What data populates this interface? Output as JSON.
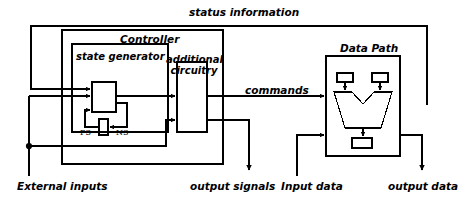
{
  "diagram": {
    "title_visible": false,
    "type": "block-diagram",
    "colors": {
      "line": "#000000",
      "background": "#ffffff",
      "text": "#000000"
    },
    "labels": {
      "status_information": "status information",
      "controller": "Controller",
      "state_generator": "state generator",
      "additional_circuitry_line1": "additional",
      "additional_circuitry_line2": "circuitry",
      "commands": "commands",
      "data_path": "Data Path",
      "ps": "PS",
      "ns": "NS",
      "external_inputs": "External inputs",
      "output_signals": "output signals",
      "input_data": "Input data",
      "output_data": "output data"
    },
    "blocks": [
      {
        "name": "controller",
        "label": "Controller",
        "x": 62,
        "y": 30,
        "w": 161,
        "h": 134
      },
      {
        "name": "state-generator",
        "label": "state generator",
        "x": 72,
        "y": 44,
        "w": 96,
        "h": 88
      },
      {
        "name": "additional-circuitry",
        "label": "additional circuitry",
        "x": 177,
        "y": 62,
        "w": 30,
        "h": 70
      },
      {
        "name": "data-path",
        "label": "Data Path",
        "x": 326,
        "y": 56,
        "w": 74,
        "h": 100
      },
      {
        "name": "state-register-main",
        "label": "",
        "x": 92,
        "y": 82,
        "w": 24,
        "h": 30
      },
      {
        "name": "state-register-ps-ns",
        "label": "",
        "x": 99,
        "y": 119,
        "w": 9,
        "h": 16
      },
      {
        "name": "datapath-register-left",
        "label": "",
        "x": 337,
        "y": 73,
        "w": 16,
        "h": 9
      },
      {
        "name": "datapath-register-right",
        "label": "",
        "x": 372,
        "y": 73,
        "w": 16,
        "h": 9
      },
      {
        "name": "datapath-register-output",
        "label": "",
        "x": 352,
        "y": 138,
        "w": 20,
        "h": 10
      }
    ],
    "signals": [
      {
        "name": "status-information",
        "label": "status information",
        "from": "data-path",
        "to": "state-generator"
      },
      {
        "name": "commands",
        "label": "commands",
        "from": "controller",
        "to": "data-path"
      },
      {
        "name": "external-inputs",
        "label": "External inputs",
        "direction": "in"
      },
      {
        "name": "output-signals",
        "label": "output signals",
        "direction": "out"
      },
      {
        "name": "input-data",
        "label": "Input data",
        "direction": "in"
      },
      {
        "name": "output-data",
        "label": "output data",
        "direction": "out"
      }
    ]
  }
}
